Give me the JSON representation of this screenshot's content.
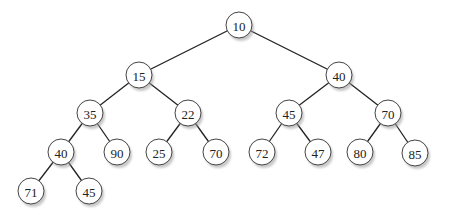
{
  "diagram": {
    "type": "binary-tree",
    "node_radius": 13,
    "shadow_offset": [
      2,
      3
    ],
    "colors": {
      "background": "#ffffff",
      "edge": "#222222",
      "node_fill": "#ffffff",
      "node_stroke": "#444444",
      "shadow": "#9a9a9a",
      "text": "#222222"
    },
    "nodes": [
      {
        "id": "n1",
        "label": "10",
        "x": 239,
        "y": 25
      },
      {
        "id": "n2",
        "label": "15",
        "x": 139,
        "y": 75
      },
      {
        "id": "n3",
        "label": "40",
        "x": 339,
        "y": 75
      },
      {
        "id": "n4",
        "label": "35",
        "x": 90,
        "y": 113
      },
      {
        "id": "n5",
        "label": "22",
        "x": 188,
        "y": 113
      },
      {
        "id": "n6",
        "label": "45",
        "x": 289,
        "y": 113
      },
      {
        "id": "n7",
        "label": "70",
        "x": 388,
        "y": 113
      },
      {
        "id": "n8",
        "label": "40",
        "x": 61,
        "y": 152
      },
      {
        "id": "n9",
        "label": "90",
        "x": 117,
        "y": 152
      },
      {
        "id": "n10",
        "label": "25",
        "x": 159,
        "y": 152
      },
      {
        "id": "n11",
        "label": "70",
        "x": 216,
        "y": 152
      },
      {
        "id": "n12",
        "label": "72",
        "x": 262,
        "y": 152
      },
      {
        "id": "n13",
        "label": "47",
        "x": 318,
        "y": 152
      },
      {
        "id": "n14",
        "label": "80",
        "x": 360,
        "y": 152
      },
      {
        "id": "n15",
        "label": "85",
        "x": 415,
        "y": 153
      },
      {
        "id": "n16",
        "label": "71",
        "x": 31,
        "y": 191
      },
      {
        "id": "n17",
        "label": "45",
        "x": 89,
        "y": 191
      }
    ],
    "edges": [
      {
        "from": "n1",
        "to": "n2"
      },
      {
        "from": "n1",
        "to": "n3"
      },
      {
        "from": "n2",
        "to": "n4"
      },
      {
        "from": "n2",
        "to": "n5"
      },
      {
        "from": "n3",
        "to": "n6"
      },
      {
        "from": "n3",
        "to": "n7"
      },
      {
        "from": "n4",
        "to": "n8"
      },
      {
        "from": "n4",
        "to": "n9"
      },
      {
        "from": "n5",
        "to": "n10"
      },
      {
        "from": "n5",
        "to": "n11"
      },
      {
        "from": "n6",
        "to": "n12"
      },
      {
        "from": "n6",
        "to": "n13"
      },
      {
        "from": "n7",
        "to": "n14"
      },
      {
        "from": "n7",
        "to": "n15"
      },
      {
        "from": "n8",
        "to": "n16"
      },
      {
        "from": "n8",
        "to": "n17"
      }
    ]
  }
}
